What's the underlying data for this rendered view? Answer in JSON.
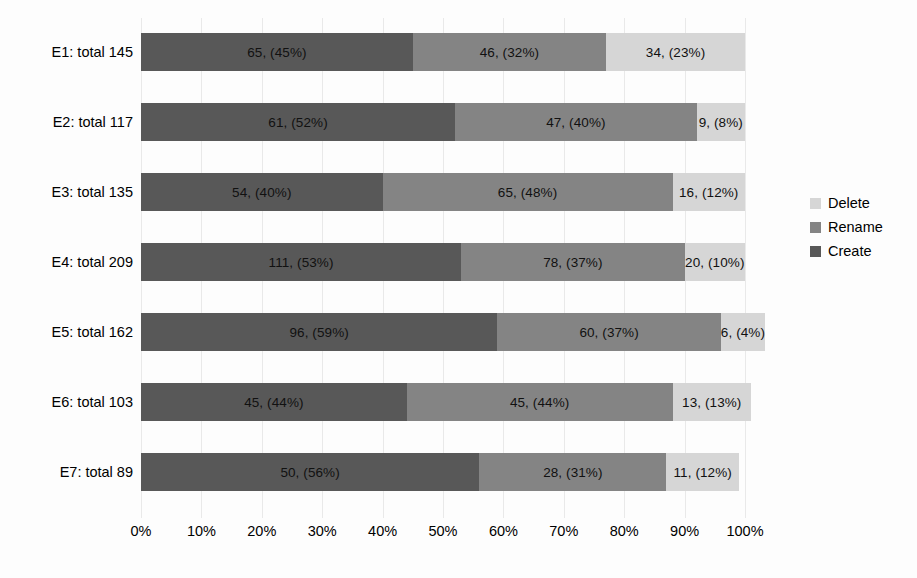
{
  "chart_data": {
    "type": "bar",
    "orientation": "horizontal",
    "stacked": true,
    "normalized": true,
    "title": "",
    "xlabel": "",
    "ylabel": "",
    "xlim": [
      0,
      100
    ],
    "grid": true,
    "legend_position": "right",
    "x_tick_labels": [
      "0%",
      "10%",
      "20%",
      "30%",
      "40%",
      "50%",
      "60%",
      "70%",
      "80%",
      "90%",
      "100%"
    ],
    "x_tick_values": [
      0,
      10,
      20,
      30,
      40,
      50,
      60,
      70,
      80,
      90,
      100
    ],
    "categories": [
      "E1: total 145",
      "E2: total 117",
      "E3: total 135",
      "E4: total 209",
      "E5: total 162",
      "E6: total 103",
      "E7: total 89"
    ],
    "category_totals": [
      145,
      117,
      135,
      209,
      162,
      103,
      89
    ],
    "series": [
      {
        "name": "Create",
        "color": "#585858",
        "values": [
          65,
          61,
          54,
          111,
          96,
          45,
          50
        ],
        "percents": [
          45,
          52,
          40,
          53,
          59,
          44,
          56
        ],
        "labels": [
          "65, (45%)",
          "61, (52%)",
          "54, (40%)",
          "111, (53%)",
          "96, (59%)",
          "45, (44%)",
          "50, (56%)"
        ]
      },
      {
        "name": "Rename",
        "color": "#848484",
        "values": [
          46,
          47,
          65,
          78,
          60,
          45,
          28
        ],
        "percents": [
          32,
          40,
          48,
          37,
          37,
          44,
          31
        ],
        "labels": [
          "46, (32%)",
          "47, (40%)",
          "65, (48%)",
          "78, (37%)",
          "60, (37%)",
          "45, (44%)",
          "28, (31%)"
        ]
      },
      {
        "name": "Delete",
        "color": "#d6d6d6",
        "values": [
          34,
          9,
          16,
          20,
          6,
          13,
          11
        ],
        "percents": [
          23,
          8,
          12,
          10,
          4,
          13,
          12
        ],
        "labels": [
          "34, (23%)",
          "9, (8%)",
          "16, (12%)",
          "20, (10%)",
          "6, (4%)",
          "13, (13%)",
          "11, (12%)"
        ]
      }
    ],
    "legend_entries": [
      {
        "label": "Delete",
        "color": "#d6d6d6"
      },
      {
        "label": "Rename",
        "color": "#848484"
      },
      {
        "label": "Create",
        "color": "#585858"
      }
    ]
  }
}
